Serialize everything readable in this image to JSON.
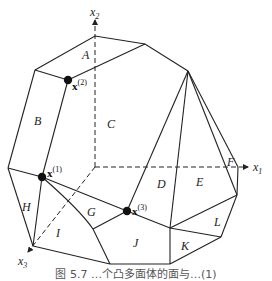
{
  "diagram": {
    "axes": {
      "x1": "x",
      "x1_sub": "1",
      "x2": "x",
      "x2_sub": "2",
      "x3": "x",
      "x3_sub": "3"
    },
    "regions": [
      "A",
      "B",
      "C",
      "D",
      "E",
      "F",
      "G",
      "H",
      "I",
      "J",
      "K",
      "L"
    ],
    "points": [
      {
        "name": "x",
        "sup": "(1)"
      },
      {
        "name": "x",
        "sup": "(2)"
      },
      {
        "name": "x",
        "sup": "(3)"
      }
    ],
    "caption": "图 5.7  …个凸多面体的面与…(1)"
  }
}
